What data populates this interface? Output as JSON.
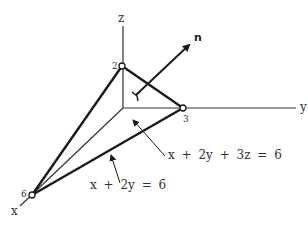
{
  "diagram": {
    "type": "3d-coordinate-plane",
    "axes": {
      "x": "x",
      "y": "y",
      "z": "z"
    },
    "intercepts": {
      "x": "6",
      "y": "3",
      "z": "2"
    },
    "normal_vector_label": "n",
    "equations": {
      "plane": "x + 2y + 3z = 6",
      "trace": "x + 2y = 6"
    },
    "colors": {
      "line": "#1a1a1a",
      "axis": "#333333",
      "background": "#ffffff"
    }
  }
}
